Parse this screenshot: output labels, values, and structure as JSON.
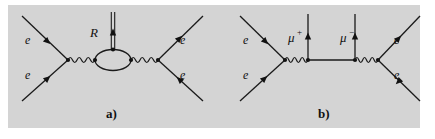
{
  "figure": {
    "background_color": "#ffffff",
    "panel_color": "#d4d4d4",
    "ink_color": "#1a1a1a",
    "width": 435,
    "height": 139
  },
  "panels": [
    {
      "id": "panel-a",
      "caption": "a)",
      "caption_position": {
        "x": 110,
        "y": 117
      },
      "description": "Electron-electron scattering with a fermion loop bubble emitting an R boson",
      "external_lines": [
        {
          "name": "incoming-electron-upper-left",
          "label": "e",
          "label_pos": {
            "x": 25,
            "y": 44
          },
          "arrow": "inward"
        },
        {
          "name": "incoming-electron-lower-left",
          "label": "e",
          "label_pos": {
            "x": 25,
            "y": 79
          },
          "arrow": "inward"
        },
        {
          "name": "outgoing-electron-upper-right",
          "label": "e",
          "label_pos": {
            "x": 180,
            "y": 44
          },
          "arrow": "outward"
        },
        {
          "name": "outgoing-electron-lower-right",
          "label": "e",
          "label_pos": {
            "x": 180,
            "y": 79
          },
          "arrow": "outward"
        }
      ],
      "internal_lines": [
        {
          "name": "photon-left",
          "type": "wavy",
          "cycles": 3
        },
        {
          "name": "photon-right",
          "type": "wavy",
          "cycles": 3
        },
        {
          "name": "loop-bubble",
          "type": "ellipse"
        },
        {
          "name": "r-boson",
          "type": "double-line",
          "label": "R",
          "label_pos": {
            "x": 90,
            "y": 36
          },
          "arrow": "up"
        }
      ]
    },
    {
      "id": "panel-b",
      "caption": "b)",
      "caption_position": {
        "x": 322,
        "y": 117
      },
      "description": "Electron-electron scattering via two photons producing a muon pair box",
      "external_lines": [
        {
          "name": "incoming-electron-upper-left",
          "label": "e",
          "label_pos": {
            "x": 243,
            "y": 44
          },
          "arrow": "inward"
        },
        {
          "name": "incoming-electron-lower-left",
          "label": "e",
          "label_pos": {
            "x": 243,
            "y": 79
          },
          "arrow": "inward"
        },
        {
          "name": "outgoing-electron-upper-right",
          "label": "e",
          "label_pos": {
            "x": 395,
            "y": 44
          },
          "arrow": "outward"
        },
        {
          "name": "outgoing-electron-lower-right",
          "label": "e",
          "label_pos": {
            "x": 395,
            "y": 79
          },
          "arrow": "outward"
        },
        {
          "name": "muon-plus",
          "label": "μ",
          "charge": "+",
          "label_pos": {
            "x": 287,
            "y": 42
          },
          "arrow": "up"
        },
        {
          "name": "muon-minus",
          "label": "μ",
          "charge": "−",
          "label_pos": {
            "x": 341,
            "y": 42
          },
          "arrow": "up"
        }
      ],
      "internal_lines": [
        {
          "name": "photon-left",
          "type": "wavy",
          "cycles": 3
        },
        {
          "name": "photon-right",
          "type": "wavy",
          "cycles": 3
        },
        {
          "name": "muon-propagator-horizontal",
          "type": "straight"
        }
      ]
    }
  ]
}
